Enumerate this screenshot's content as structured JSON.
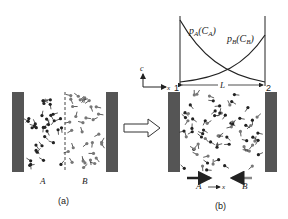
{
  "diagram": {
    "panel_a": {
      "caption": "(a)",
      "label_left": "A",
      "label_right": "B"
    },
    "panel_b": {
      "caption": "(b)",
      "curve_a_label": "p",
      "curve_a_sub": "A",
      "curve_a_arg": "(C",
      "curve_a_arg_sub": "A",
      "curve_b_label": "p",
      "curve_b_sub": "B",
      "curve_b_arg": "(C",
      "curve_b_arg_sub": "B",
      "axis_c": "c",
      "axis_x": "x",
      "point_1": "1",
      "point_2": "2",
      "length": "L",
      "flux_a": "A",
      "flux_b": "B",
      "flux_axis": "x"
    },
    "colors": {
      "wall": "#555555",
      "particle": "#333333",
      "line": "#222222"
    }
  }
}
